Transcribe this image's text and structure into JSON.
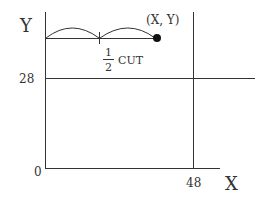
{
  "diagram": {
    "axis_x_label": "X",
    "axis_y_label": "Y",
    "origin_label": "0",
    "x_tick_label": "48",
    "y_tick_label": "28",
    "point_label": "(X, Y)",
    "fraction_numerator": "1",
    "fraction_denominator": "2",
    "cut_label": "CUT",
    "colors": {
      "line": "#333333",
      "text": "#333333"
    }
  }
}
